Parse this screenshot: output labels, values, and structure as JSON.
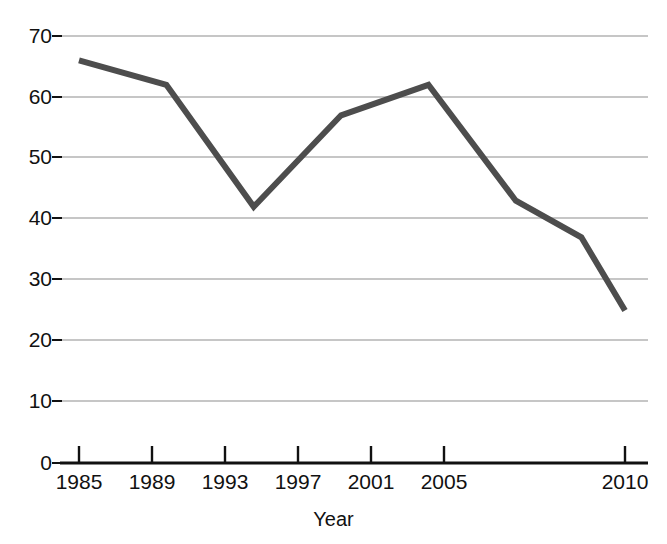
{
  "chart_data": {
    "type": "line",
    "title": "",
    "xlabel": "Year",
    "ylabel": "",
    "x": [
      1985,
      1989,
      1993,
      1997,
      2001,
      2005,
      2008,
      2010
    ],
    "values": [
      66,
      62,
      42,
      57,
      62,
      43,
      37,
      25
    ],
    "series": [
      {
        "name": "",
        "values": [
          66,
          62,
          42,
          57,
          62,
          43,
          37,
          25
        ],
        "color": "#4d4d4d"
      }
    ],
    "x_tick_labels": [
      "1985",
      "1989",
      "1993",
      "1997",
      "2001",
      "2005",
      "2010"
    ],
    "x_tick_values": [
      1985,
      1989,
      1993,
      1997,
      2001,
      2005,
      2010
    ],
    "y_tick_labels": [
      "0",
      "10",
      "20",
      "30",
      "40",
      "50",
      "60",
      "70"
    ],
    "y_tick_values": [
      0,
      10,
      20,
      30,
      40,
      50,
      60,
      70
    ],
    "xlim": [
      1985,
      2010
    ],
    "ylim": [
      0,
      70
    ],
    "grid": "horizontal",
    "legend": "none",
    "line_color": "#4d4d4d",
    "grid_color": "#b3b3b3",
    "axis_color": "#111111",
    "background": "#ffffff"
  },
  "axes": {
    "x_title": "Year",
    "y_title": ""
  },
  "ytick_0": "0",
  "ytick_1": "10",
  "ytick_2": "20",
  "ytick_3": "30",
  "ytick_4": "40",
  "ytick_5": "50",
  "ytick_6": "60",
  "ytick_7": "70",
  "xtick_0": "1985",
  "xtick_1": "1989",
  "xtick_2": "1993",
  "xtick_3": "1997",
  "xtick_4": "2001",
  "xtick_5": "2005",
  "xtick_6": "2010"
}
